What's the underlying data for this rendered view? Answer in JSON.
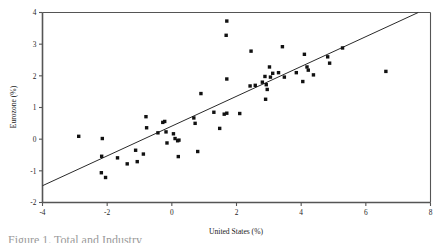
{
  "figure": {
    "caption_fragment": "Figure 1. Total and Industry"
  },
  "chart_data": {
    "type": "scatter",
    "title": "",
    "xlabel": "United States (%)",
    "ylabel": "Eurozone (%)",
    "xlim": [
      -4,
      8
    ],
    "ylim": [
      -2,
      4
    ],
    "xticks": [
      -4,
      -2,
      0,
      2,
      4,
      6,
      8
    ],
    "xticklabels": [
      "-4",
      "-2",
      "0",
      "2",
      "4",
      "6",
      "8"
    ],
    "yticks": [
      -2,
      -1,
      0,
      1,
      2,
      3,
      4
    ],
    "yticklabels": [
      "-2",
      "-1",
      "0",
      "1",
      "2",
      "3",
      "4"
    ],
    "grid": false,
    "legend": false,
    "marker": "square",
    "marker_color": "#111111",
    "series": [
      {
        "name": "Observations",
        "points": [
          [
            -2.88,
            0.09
          ],
          [
            -2.15,
            0.02
          ],
          [
            -2.17,
            -0.54
          ],
          [
            -2.18,
            -1.06
          ],
          [
            -2.05,
            -1.21
          ],
          [
            -1.68,
            -0.59
          ],
          [
            -1.38,
            -0.78
          ],
          [
            -1.12,
            -0.35
          ],
          [
            -1.07,
            -0.71
          ],
          [
            -0.88,
            -0.47
          ],
          [
            -0.8,
            0.71
          ],
          [
            -0.78,
            0.36
          ],
          [
            -0.43,
            0.2
          ],
          [
            -0.28,
            0.53
          ],
          [
            -0.22,
            0.56
          ],
          [
            -0.18,
            0.23
          ],
          [
            -0.15,
            -0.12
          ],
          [
            0.05,
            0.17
          ],
          [
            0.1,
            0.02
          ],
          [
            0.18,
            -0.05
          ],
          [
            0.22,
            -0.03
          ],
          [
            0.2,
            -0.55
          ],
          [
            0.68,
            0.67
          ],
          [
            0.72,
            0.5
          ],
          [
            0.8,
            -0.39
          ],
          [
            0.9,
            1.44
          ],
          [
            1.3,
            0.85
          ],
          [
            1.48,
            0.34
          ],
          [
            1.62,
            0.79
          ],
          [
            1.7,
            0.82
          ],
          [
            1.7,
            1.9
          ],
          [
            1.68,
            3.28
          ],
          [
            1.7,
            3.73
          ],
          [
            2.1,
            0.81
          ],
          [
            2.42,
            1.68
          ],
          [
            2.45,
            2.78
          ],
          [
            2.58,
            1.7
          ],
          [
            2.8,
            1.8
          ],
          [
            2.88,
            1.98
          ],
          [
            2.92,
            1.72
          ],
          [
            2.95,
            1.57
          ],
          [
            2.9,
            1.26
          ],
          [
            3.02,
            2.28
          ],
          [
            3.05,
            1.96
          ],
          [
            3.12,
            2.08
          ],
          [
            3.3,
            2.1
          ],
          [
            3.42,
            2.92
          ],
          [
            3.48,
            1.96
          ],
          [
            3.85,
            2.1
          ],
          [
            4.05,
            1.82
          ],
          [
            4.1,
            2.68
          ],
          [
            4.18,
            2.28
          ],
          [
            4.22,
            2.18
          ],
          [
            4.38,
            2.03
          ],
          [
            4.82,
            2.6
          ],
          [
            4.88,
            2.4
          ],
          [
            5.28,
            2.88
          ],
          [
            6.62,
            2.14
          ]
        ]
      }
    ],
    "fit_line": {
      "name": "Regression line",
      "x_start": -4,
      "y_start": -1.47,
      "x_end": 7.62,
      "y_end": 4.0
    }
  }
}
